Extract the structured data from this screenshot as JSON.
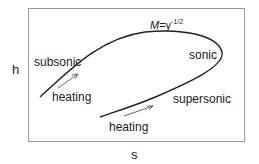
{
  "diagram": {
    "axes": {
      "x_label": "s",
      "y_label": "h"
    },
    "curve_label": {
      "prefix": "M",
      "eq": "=γ",
      "exponent": "-1/2"
    },
    "labels": {
      "subsonic": "subsonic",
      "sonic": "sonic",
      "supersonic": "supersonic",
      "heating_upper": "heating",
      "heating_lower": "heating"
    },
    "colors": {
      "curve": "#222222",
      "frame": "#9a9a9a",
      "arrow": "#555555"
    }
  }
}
